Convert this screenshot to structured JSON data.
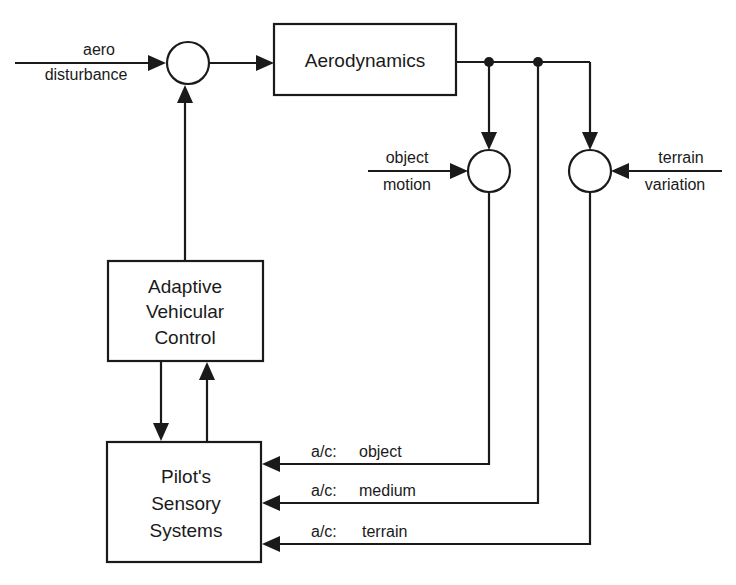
{
  "diagram": {
    "type": "block-diagram",
    "blocks": {
      "aerodynamics": {
        "label": "Aerodynamics"
      },
      "adaptive_control": {
        "lines": [
          "Adaptive",
          "Vehicular",
          "Control"
        ]
      },
      "pilot_sensory": {
        "lines": [
          "Pilot's",
          "Sensory",
          "Systems"
        ]
      }
    },
    "summing_junctions": {
      "main": {
        "name": "main-sum"
      },
      "object": {
        "name": "object-sum"
      },
      "terrain": {
        "name": "terrain-sum"
      }
    },
    "inputs": {
      "aero_disturbance": {
        "lines": [
          "aero",
          "disturbance"
        ]
      },
      "object_motion": {
        "lines": [
          "object",
          "motion"
        ]
      },
      "terrain_variation": {
        "lines": [
          "terrain",
          "variation"
        ]
      }
    },
    "feedback": {
      "object": {
        "prefix": "a/c:",
        "label": "object"
      },
      "medium": {
        "prefix": "a/c:",
        "label": "medium"
      },
      "terrain": {
        "prefix": "a/c:",
        "label": "terrain"
      }
    },
    "colors": {
      "stroke": "#1a1a1a",
      "background": "#ffffff"
    }
  }
}
